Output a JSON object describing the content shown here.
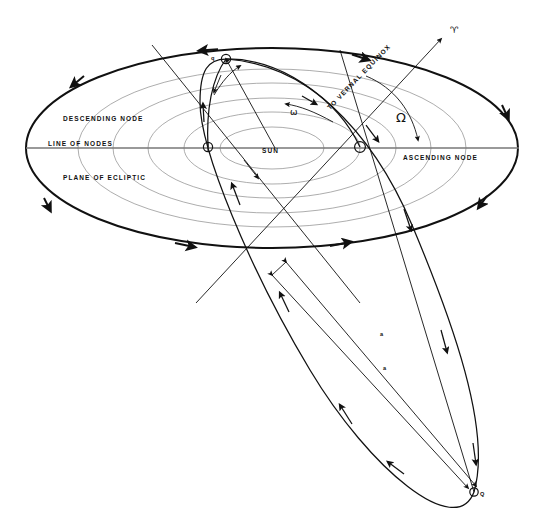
{
  "diagram": {
    "type": "astronomy-orbital-elements",
    "background_color": "#ffffff",
    "ink_color": "#111111",
    "faint_color": "#8a8a8a"
  },
  "labels": {
    "descending_node": "DESCENDING NODE",
    "line_of_nodes": "LINE OF NODES",
    "plane_of_ecliptic": "PLANE OF ECLIPTIC",
    "ascending_node": "ASCENDING NODE",
    "to_vernal_equinox": "TO VERNAL EQUINOX",
    "sun": "SUN",
    "perihelion": "q",
    "aphelion": "Q",
    "semi_major_axis_1": "a",
    "semi_major_axis_2": "a",
    "argument_of_perihelion": "ω",
    "longitude_of_ascending_node": "Ω",
    "aries_symbol": "♈"
  },
  "markers": {
    "sun_point": {
      "x": 275,
      "y": 148
    },
    "descending_node_point": {
      "x": 208,
      "y": 147
    },
    "ascending_node_point": {
      "x": 360,
      "y": 147
    },
    "perihelion_point": {
      "x": 226,
      "y": 59
    },
    "aphelion_point": {
      "x": 474,
      "y": 492
    },
    "vernal_equinox_arrow_tip": {
      "x": 441,
      "y": 39
    }
  },
  "ecliptic": {
    "center": {
      "x": 272,
      "y": 148
    },
    "outer_rx": 246,
    "outer_ry": 100,
    "inner_orbit_rx": [
      194,
      159,
      124,
      88,
      52
    ],
    "inner_orbit_ry": [
      79,
      65,
      50,
      36,
      21
    ],
    "inner_orbit_count": 5
  },
  "icons": {
    "aries": "aries-icon",
    "omega_capital": "omega-capital-icon",
    "omega_small": "omega-small-icon"
  }
}
